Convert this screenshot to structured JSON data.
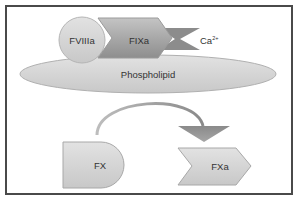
{
  "diagram": {
    "nodes": {
      "fviiia": {
        "label": "FVIIIa",
        "shape": "circle"
      },
      "fixa": {
        "label": "FIXa",
        "shape": "chevron"
      },
      "calcium": {
        "label_base": "Ca",
        "label_sup": "2+",
        "shape": "bowtie"
      },
      "phospholipid": {
        "label": "Phospholipid",
        "shape": "ellipse"
      },
      "fx": {
        "label": "FX",
        "shape": "d-shape"
      },
      "fxa": {
        "label": "FXa",
        "shape": "chevron"
      }
    },
    "edges": [
      {
        "from": "fx",
        "to": "fxa",
        "style": "curved-arrow"
      }
    ],
    "colors": {
      "frame": "#4a4a4a",
      "light_fill": "#d6d6d6",
      "mid_fill": "#a9a9a9",
      "dark_fill": "#8c8c8c",
      "arrow": "#8a8a8a",
      "text": "#333333"
    }
  }
}
